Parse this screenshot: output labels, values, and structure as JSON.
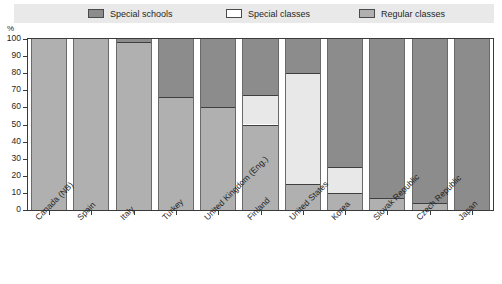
{
  "axis": {
    "unit_label": "%",
    "y_ticks": [
      "100",
      "90",
      "80",
      "70",
      "60",
      "50",
      "40",
      "30",
      "20",
      "10",
      "0"
    ]
  },
  "legend": {
    "entries": [
      {
        "label": "Special schools",
        "color": "#8c8c8c",
        "key": "special_schools"
      },
      {
        "label": "Special classes",
        "color": "#e8e8e8",
        "key": "special_classes"
      },
      {
        "label": "Regular classes",
        "color": "#b0b0b0",
        "key": "regular_classes"
      }
    ]
  },
  "chart_data": {
    "type": "bar",
    "subtype": "stacked-100-percent",
    "title": "",
    "xlabel": "",
    "ylabel": "%",
    "ylim": [
      0,
      100
    ],
    "ytick_step": 10,
    "grid": false,
    "legend_position": "top",
    "stack_order_top_to_bottom": [
      "Special schools",
      "Special classes",
      "Regular classes"
    ],
    "categories": [
      "Canada (NB)",
      "Spain",
      "Italy",
      "Turkey",
      "United Kingdom (Eng.)",
      "Finland",
      "United States",
      "Korea",
      "Slovak Republic",
      "Czech Republic",
      "Japan"
    ],
    "series": [
      {
        "name": "Special schools",
        "color": "#8c8c8c",
        "values": [
          0,
          0,
          2,
          34,
          40,
          33,
          20,
          75,
          93,
          96,
          100
        ]
      },
      {
        "name": "Special classes",
        "color": "#e8e8e8",
        "values": [
          0,
          0,
          0,
          0,
          0,
          17,
          65,
          15,
          0,
          0,
          0
        ]
      },
      {
        "name": "Regular classes",
        "color": "#b0b0b0",
        "values": [
          100,
          100,
          98,
          66,
          60,
          50,
          15,
          10,
          7,
          4,
          0
        ]
      }
    ]
  }
}
